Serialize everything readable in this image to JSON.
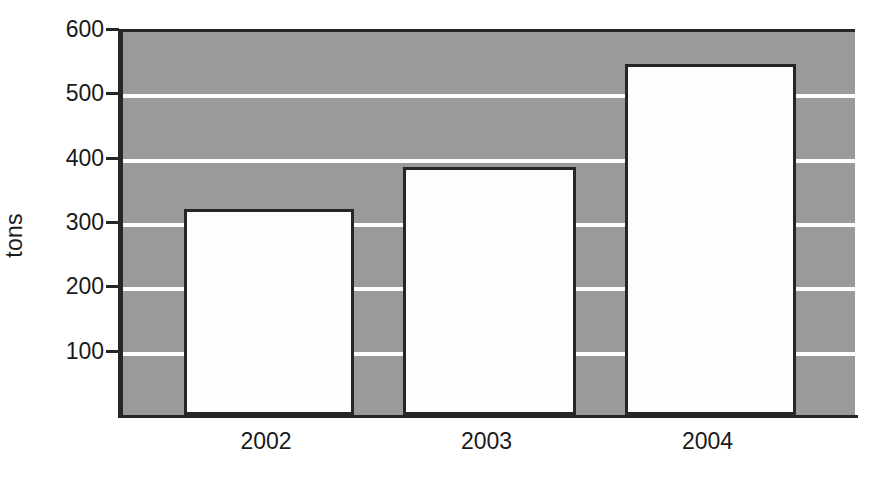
{
  "chart_data": {
    "type": "bar",
    "title": "",
    "subtitle": "",
    "xlabel": "",
    "ylabel": "tons",
    "categories": [
      "2002",
      "2003",
      "2004"
    ],
    "values": [
      320,
      385,
      545
    ],
    "series": [
      {
        "name": "tons",
        "values": [
          320,
          385,
          545
        ]
      }
    ],
    "ylim": [
      0,
      600
    ],
    "y_ticks": [
      100,
      200,
      300,
      400,
      500,
      600
    ],
    "y_tick_labels": [
      "100",
      "200",
      "300",
      "400",
      "500",
      "600"
    ],
    "x_tick_labels": [
      "2002",
      "2003",
      "2004"
    ],
    "grid": true,
    "grid_orientation": "horizontal",
    "grid_color": "#fdfdfd",
    "legend": false,
    "legend_position": "none",
    "plot_background_color": "#9a9a9a",
    "bar_fill_color": "#fdfdfd",
    "bar_edge_color": "#262626",
    "axis_color": "#262626",
    "text_color": "#1a1a1a",
    "figure_background_color": "#ffffff"
  }
}
